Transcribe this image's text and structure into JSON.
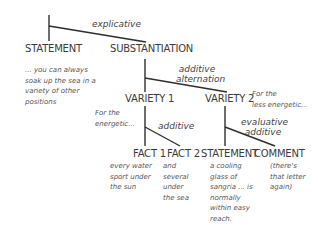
{
  "diagram": {
    "relations": {
      "explicative": "explicative",
      "additive_alternation_1": "additive",
      "additive_alternation_2": "alternation",
      "additive": "additive",
      "evaluative_additive_1": "evaluative",
      "evaluative_additive_2": "additive"
    },
    "nodes": {
      "statement_top": "STATEMENT",
      "substantiation": "SUBSTANTIATION",
      "variety1": "VARIETY 1",
      "variety2": "VARIETY 2",
      "fact1": "FACT 1",
      "fact2": "FACT 2",
      "statement_bottom": "STATEMENT",
      "comment": "COMMENT"
    },
    "notes": {
      "statement_top": [
        "... you can always",
        "soak up the sea in a",
        "variety of other",
        "positions"
      ],
      "variety1": [
        "For the",
        "energetic..."
      ],
      "variety2": [
        "For the",
        "less energetic..."
      ],
      "fact1": [
        "every water",
        "sport under",
        "the sun"
      ],
      "fact2": [
        "and",
        "several",
        "under",
        "the sea"
      ],
      "statement_bottom": [
        "a cooling",
        "glass of",
        "sangria ... is",
        "normally",
        "within easy",
        "reach."
      ],
      "comment": [
        "(there's",
        "that letter",
        "again)"
      ]
    },
    "colors": {
      "line": "#2e2e2e",
      "text": "#3b3b3b"
    }
  }
}
